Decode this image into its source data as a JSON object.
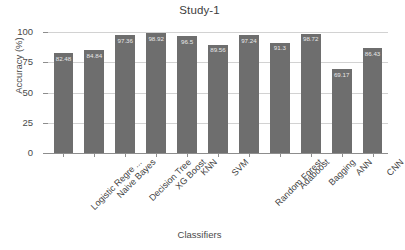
{
  "chart_data": {
    "type": "bar",
    "title": "Study-1",
    "xlabel": "Classifiers",
    "ylabel": "Accuracy (%)",
    "ylim": [
      0,
      100
    ],
    "yticks": [
      0,
      25,
      50,
      75,
      100
    ],
    "grid": true,
    "legend": "none",
    "bar_color": "#6e6e6e",
    "value_label_color": "#e8e8e8",
    "categories": [
      "Logistic Regre ...",
      "Naive Bayes",
      "Decision Tree",
      "XG Boost",
      "KNN",
      "SVM",
      "Random Forest",
      "Adaboost",
      "Bagging",
      "ANN",
      "CNN"
    ],
    "values": [
      82.48,
      84.84,
      97.36,
      98.92,
      96.5,
      89.56,
      97.24,
      91.3,
      98.72,
      69.17,
      86.43
    ],
    "value_labels": [
      "82.48",
      "84.84",
      "97.36",
      "98.92",
      "96.5",
      "89.56",
      "97.24",
      "91.3",
      "98.72",
      "69.17",
      "86.43"
    ]
  }
}
